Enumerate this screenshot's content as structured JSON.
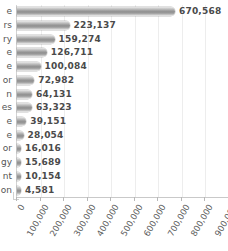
{
  "chart_data": {
    "type": "bar",
    "orientation": "horizontal",
    "title": "",
    "xlabel": "",
    "ylabel": "",
    "xlim": [
      0,
      900000
    ],
    "grid": true,
    "legend": null,
    "categories": [
      "e",
      "rs",
      "ry",
      "e",
      "e",
      "or",
      "n",
      "es",
      "e",
      "e",
      "or",
      "gy",
      "nt",
      "on"
    ],
    "values": [
      670568,
      223137,
      159274,
      126711,
      100084,
      72982,
      64131,
      63323,
      39151,
      28054,
      16016,
      15689,
      10154,
      4581
    ],
    "value_labels": [
      "670,568",
      "223,137",
      "159,274",
      "126,711",
      "100,084",
      "72,982",
      "64,131",
      "63,323",
      "39,151",
      "28,054",
      "16,016",
      "15,689",
      "10,154",
      "4,581"
    ],
    "xticks": [
      0,
      100000,
      200000,
      300000,
      400000,
      500000,
      600000,
      700000,
      800000,
      900000
    ],
    "xtick_labels": [
      "0",
      "100,000",
      "200,000",
      "300,000",
      "400,000",
      "500,000",
      "600,000",
      "700,000",
      "800,000",
      "900,000"
    ],
    "colors": {
      "bar_light": "#e9e9e9",
      "bar_mid": "#8e8e8e",
      "bar_dark": "#9d9d9d",
      "gridline": "#ededed",
      "axis": "#c9c9c9",
      "label_text": "#4a4a4a",
      "tick_text": "#5a5a5a",
      "background": "#ffffff"
    }
  }
}
